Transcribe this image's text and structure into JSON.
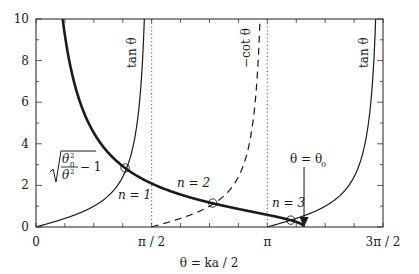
{
  "chart_data": {
    "type": "line",
    "title": "",
    "xlabel": "θ = ka / 2",
    "ylabel": "",
    "xlim": [
      0,
      4.71238898
    ],
    "ylim": [
      0,
      10
    ],
    "grid": false,
    "x_ticks": [
      {
        "value": 0,
        "label": "0"
      },
      {
        "value": 1.5707963,
        "label": "π / 2"
      },
      {
        "value": 3.1415927,
        "label": "π"
      },
      {
        "value": 4.712389,
        "label": "3π / 2"
      }
    ],
    "y_ticks": [
      {
        "value": 0,
        "label": "0"
      },
      {
        "value": 2,
        "label": "2"
      },
      {
        "value": 4,
        "label": "4"
      },
      {
        "value": 6,
        "label": "6"
      },
      {
        "value": 8,
        "label": "8"
      },
      {
        "value": 10,
        "label": "10"
      }
    ],
    "theta0": 3.64,
    "series": [
      {
        "name": "tan θ (branch 1)",
        "function": "tan",
        "domain": [
          0,
          1.5708
        ],
        "style": "solid",
        "width": 1.2
      },
      {
        "name": "−cot θ",
        "function": "-cot",
        "domain": [
          1.5708,
          3.1416
        ],
        "style": "dashed",
        "width": 1.2
      },
      {
        "name": "tan θ (branch 2)",
        "function": "tan",
        "domain": [
          3.1416,
          4.7124
        ],
        "style": "solid",
        "width": 1.2
      },
      {
        "name": "sqrt(θ0²/θ² − 1)",
        "function": "sqrt_ratio",
        "domain": [
          0.3,
          3.64
        ],
        "style": "solid",
        "width": 2.6
      }
    ],
    "asymptotes": [
      1.5707963,
      3.1415927
    ],
    "intersections": [
      {
        "label": "n = 1",
        "x": 1.21,
        "y": 2.84
      },
      {
        "label": "n = 2",
        "x": 2.4,
        "y": 1.15
      },
      {
        "label": "n = 3",
        "x": 3.46,
        "y": 0.33
      }
    ],
    "annotations": {
      "tan1": "tan θ",
      "cot": "−cot θ",
      "tan2": "tan θ",
      "sqrt_num": "θ",
      "sqrt_num_sub": "0",
      "sqrt_num_sup": "2",
      "sqrt_den": "θ",
      "sqrt_den_sup": "2",
      "sqrt_minus": "− 1",
      "n1": "n = 1",
      "n2": "n = 2",
      "n3": "n = 3",
      "theta0_label": "θ = θ",
      "theta0_sub": "0"
    }
  }
}
